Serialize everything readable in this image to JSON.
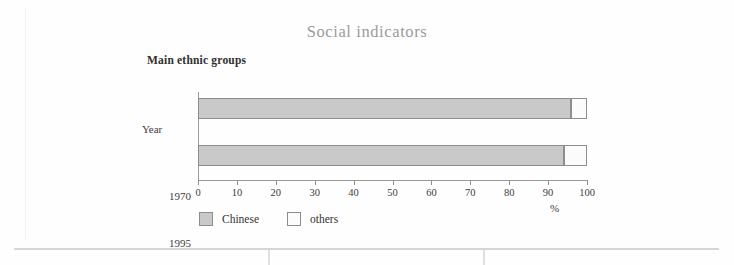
{
  "header": {
    "title": "Social indicators",
    "subtitle": "Main ethnic groups"
  },
  "colors": {
    "title": "#9b9b9b",
    "chinese_fill": "#c9c9c9",
    "others_fill": "#fbfbfb",
    "bar_border": "#8d8d8d",
    "axis": "#9a9a9a"
  },
  "axis": {
    "y_title": "Year",
    "x_unit": "%",
    "x_ticks": [
      "0",
      "10",
      "20",
      "30",
      "40",
      "50",
      "60",
      "70",
      "80",
      "90",
      "100"
    ]
  },
  "legend": {
    "items": [
      {
        "label": "Chinese",
        "key": "chinese"
      },
      {
        "label": "others",
        "key": "others"
      }
    ]
  },
  "chart_data": {
    "type": "bar",
    "orientation": "horizontal",
    "stacked": true,
    "title": "Main ethnic groups",
    "xlabel": "%",
    "ylabel": "Year",
    "xlim": [
      0,
      100
    ],
    "xtick_step": 10,
    "grid": false,
    "legend_position": "bottom-left",
    "categories": [
      "1970",
      "1995"
    ],
    "series": [
      {
        "name": "Chinese",
        "values": [
          96,
          94
        ]
      },
      {
        "name": "others",
        "values": [
          4,
          6
        ]
      }
    ]
  }
}
